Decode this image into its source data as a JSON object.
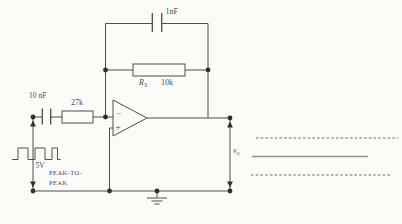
{
  "diagram": {
    "feedback": {
      "capacitor_value": "1nF",
      "resistor_name": "R",
      "resistor_sub": "3",
      "resistor_value": "10k"
    },
    "input": {
      "capacitor_value": "10 nF",
      "resistor_value": "27k",
      "source_voltage": "5V",
      "source_text_line1": "PEAK-TO-",
      "source_text_line2": "PEAK",
      "source_waveform": "square"
    },
    "opamp": {
      "inverting_label": "−",
      "noninverting_label": "+"
    },
    "output": {
      "name": "v",
      "sub": "o",
      "waveform": "triangle"
    },
    "colors": {
      "wire": "#4d4d4b",
      "node": "#2e2e2c",
      "background": "#fbfbf8",
      "waveform_center_line": "#909090"
    }
  }
}
